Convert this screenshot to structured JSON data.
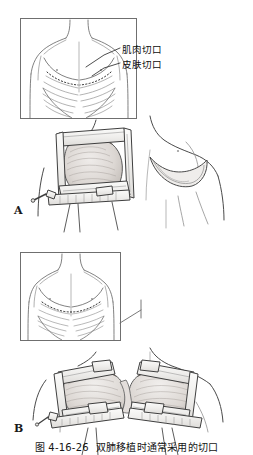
{
  "figure": {
    "caption_number": "图 4-16-26",
    "caption_text": "双肺移植时通常采用的切口",
    "panels": [
      {
        "letter": "A",
        "name": "panel-a",
        "description": "左前外侧开胸切口，肋骨撑开器牵开术野；右侧乳房下弧形皮肤切口",
        "inset": {
          "name": "panel-a-inset",
          "description": "胸部正面示意图，显示双侧乳房下虚线切口标记与肋骨、胸大肌轮廓"
        },
        "annotations": [
          {
            "name": "muscle-incision",
            "label": "肌肉切口"
          },
          {
            "name": "skin-incision",
            "label": "皮肤切口"
          }
        ]
      },
      {
        "letter": "B",
        "name": "panel-b",
        "description": "双侧前外侧开胸（蛤壳式）切口，两把肋骨撑开器同时牵开双侧胸腔",
        "inset": {
          "name": "panel-b-inset",
          "description": "胸部正面示意图，显示横跨胸骨的双侧虚线切口标记"
        },
        "annotations": []
      }
    ]
  },
  "colors": {
    "background": "#ffffff",
    "line": "#3c3c3c",
    "line_light": "#8d8d8d",
    "inset_border": "#6f6f6f",
    "tissue_fill": "#e9e6e3",
    "tissue_shade": "#cdc8c4",
    "metal_fill": "#f2f1ef",
    "text": "#111111"
  }
}
